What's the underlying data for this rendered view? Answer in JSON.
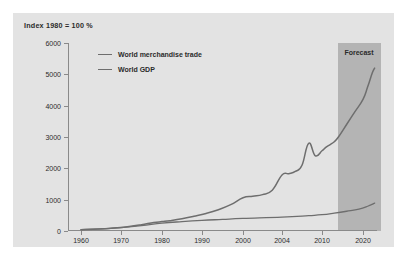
{
  "figure": {
    "title": "Index 1980 = 100 %",
    "panel_color": "#e3e3e3",
    "background_color": "#ffffff"
  },
  "annotation": {
    "forecast_label": "Forecast",
    "forecast_band_color": "#b4b4b4",
    "forecast_start_year": 2014,
    "forecast_end_year": 2025
  },
  "legend": {
    "position": "top-left-inside",
    "entries": [
      {
        "label": "World merchandise trade",
        "color": "#6e6e6e"
      },
      {
        "label": "World GDP",
        "color": "#6e6e6e"
      }
    ]
  },
  "chart_data": {
    "type": "line",
    "title": "Index 1980 = 100 %",
    "xlabel": "",
    "ylabel": "",
    "grid": false,
    "xlim": [
      1958,
      2026
    ],
    "ylim": [
      0,
      6000
    ],
    "ytick_labels": [
      "0",
      "1000",
      "2000",
      "3000",
      "4000",
      "5000",
      "6000"
    ],
    "ytick_values": [
      0,
      1000,
      2000,
      3000,
      4000,
      5000,
      6000
    ],
    "xtick_labels": [
      "1960",
      "1970",
      "1980",
      "1990",
      "2000",
      "2004",
      "2010",
      "2020"
    ],
    "xtick_values": [
      1960,
      1970,
      1980,
      1990,
      2000,
      2004,
      2010,
      2020
    ],
    "series": [
      {
        "name": "World merchandise trade",
        "color": "#6e6e6e",
        "x": [
          1960,
          1963,
          1966,
          1969,
          1972,
          1975,
          1978,
          1980,
          1982,
          1985,
          1988,
          1991,
          1994,
          1997,
          2000,
          2001,
          2002,
          2003,
          2004,
          2005,
          2006,
          2007,
          2008,
          2009,
          2010,
          2011,
          2012,
          2013,
          2014,
          2016,
          2018,
          2020,
          2022,
          2024,
          2025
        ],
        "y": [
          40,
          55,
          75,
          100,
          140,
          200,
          270,
          300,
          330,
          390,
          470,
          560,
          680,
          840,
          1060,
          1110,
          1160,
          1300,
          1790,
          1830,
          1900,
          2100,
          2800,
          2400,
          2560,
          2680,
          2760,
          2850,
          3000,
          3400,
          3800,
          4200,
          4600,
          5050,
          5200
        ]
      },
      {
        "name": "World GDP",
        "color": "#6e6e6e",
        "x": [
          1960,
          1965,
          1970,
          1975,
          1980,
          1985,
          1990,
          1995,
          2000,
          2004,
          2008,
          2010,
          2013,
          2016,
          2019,
          2022,
          2025
        ],
        "y": [
          45,
          70,
          110,
          170,
          250,
          300,
          340,
          370,
          400,
          440,
          490,
          520,
          570,
          630,
          700,
          790,
          890
        ]
      }
    ]
  }
}
